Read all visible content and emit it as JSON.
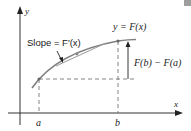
{
  "figure": {
    "y_axis_label": "y",
    "x_axis_label": "x",
    "tick_a": "a",
    "tick_b": "b",
    "curve_label": "y = F(x)",
    "slope_label": "Slope = F′(x)",
    "rise_label": "F(b) − F(a)"
  },
  "colors": {
    "axis": "#333333",
    "curve": "#7f7f7f",
    "tangent": "#9a9a9a",
    "dash": "#777777",
    "corner_block": "#9e9e9e"
  }
}
